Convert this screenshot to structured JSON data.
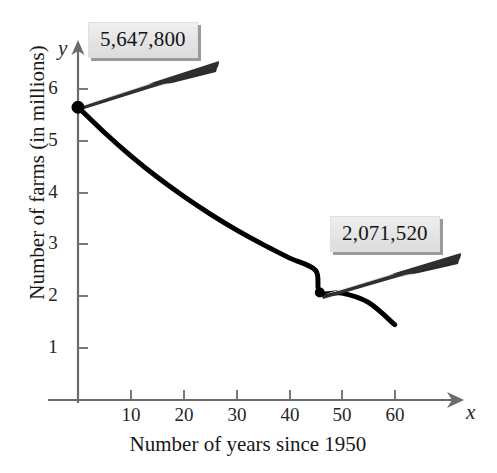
{
  "chart_data": {
    "type": "line",
    "title": "",
    "subtitle": "",
    "xlabel": "Number of years since 1950",
    "ylabel": "Number of farms (in millions)",
    "x_var_label": "x",
    "y_var_label": "y",
    "xlim": [
      0,
      66
    ],
    "ylim": [
      0,
      6.6
    ],
    "xticks": [
      10,
      20,
      30,
      40,
      50,
      60
    ],
    "yticks": [
      1,
      2,
      3,
      4,
      5,
      6
    ],
    "xtick_labels": [
      "10",
      "20",
      "30",
      "40",
      "50",
      "60"
    ],
    "ytick_labels": [
      "1",
      "2",
      "3",
      "4",
      "5",
      "6"
    ],
    "grid": false,
    "legend": "none",
    "series": [
      {
        "name": "Number of farms",
        "units": "millions",
        "x": [
          0,
          5,
          10,
          15,
          20,
          25,
          30,
          35,
          40,
          45,
          45.8,
          50,
          55,
          60
        ],
        "values": [
          5.65,
          5.16,
          4.71,
          4.3,
          3.93,
          3.59,
          3.28,
          3.0,
          2.74,
          2.5,
          2.07,
          2.06,
          1.88,
          1.45
        ]
      }
    ],
    "markers": [
      {
        "x": 0,
        "y": 5.6478,
        "label": "5,647,800"
      },
      {
        "x": 45.8,
        "y": 2.07152,
        "label": "2,071,520"
      }
    ],
    "annotations": [
      {
        "text": "5,647,800",
        "target_x": 0,
        "target_y": 5.6478
      },
      {
        "text": "2,071,520",
        "target_x": 45.8,
        "target_y": 2.07152
      }
    ],
    "colors": {
      "curve": "#000000",
      "axis": "#555555",
      "marker": "#000000",
      "callout_fill": "#e6e6e6",
      "callout_shadow": "#9a9a9a",
      "leader_dark": "#2b2b2b",
      "leader_light": "#d8d8d8",
      "background": "#ffffff"
    }
  },
  "axes": {
    "y_title": "Number of farms (in millions)",
    "x_title": "Number of years since 1950",
    "y_var": "y",
    "x_var": "x",
    "x_ticks": [
      {
        "value": "10",
        "px": 131
      },
      {
        "value": "20",
        "px": 184
      },
      {
        "value": "30",
        "px": 237
      },
      {
        "value": "40",
        "px": 290
      },
      {
        "value": "50",
        "px": 342
      },
      {
        "value": "60",
        "px": 395
      }
    ],
    "y_ticks": [
      {
        "value": "6",
        "px": 89
      },
      {
        "value": "5",
        "px": 141
      },
      {
        "value": "4",
        "px": 193
      },
      {
        "value": "3",
        "px": 244
      },
      {
        "value": "2",
        "px": 296
      },
      {
        "value": "1",
        "px": 348
      }
    ]
  },
  "callouts": [
    {
      "text": "5,647,800",
      "left": 88,
      "top": 22
    },
    {
      "text": "2,071,520",
      "left": 330,
      "top": 216
    }
  ]
}
